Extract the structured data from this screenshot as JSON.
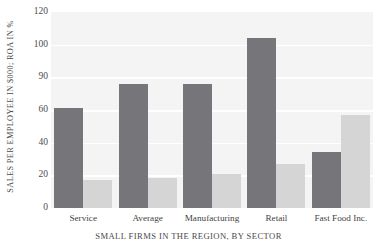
{
  "chart_data": {
    "type": "bar",
    "title": "",
    "xlabel": "SMALL FIRMS IN THE REGION, BY SECTOR",
    "ylabel": "SALES PER EMPLOYEE IN $000; ROA IN %",
    "categories": [
      "Service",
      "Average",
      "Manufacturing",
      "Retail",
      "Fast Food Inc."
    ],
    "ytick_labels": [
      "120",
      "100",
      "90",
      "60",
      "40",
      "20",
      "0"
    ],
    "ytick_positions": [
      120,
      100,
      80,
      60,
      40,
      20,
      0
    ],
    "ylim": [
      0,
      120
    ],
    "grid": true,
    "legend": "none",
    "series": [
      {
        "name": "Sales Per Employee",
        "color": "#76767a",
        "values": [
          61,
          76,
          76,
          104,
          34
        ]
      },
      {
        "name": "ROA",
        "color": "#d5d5d5",
        "values": [
          17,
          18.5,
          21,
          27,
          57
        ]
      }
    ]
  },
  "style": {
    "plot_background": "#f4f4f4",
    "gridline_color": "#ffffff",
    "page_background": "#ffffff",
    "text_color": "#4a4a4a"
  }
}
